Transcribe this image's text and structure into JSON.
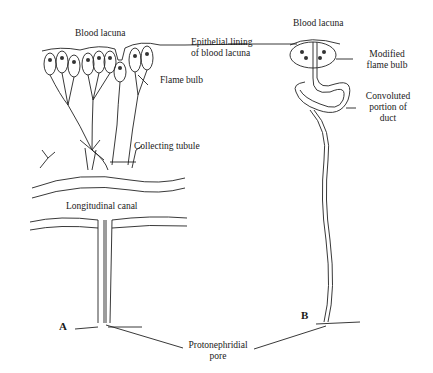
{
  "figure": {
    "panel_a": {
      "letter": "A",
      "labels": {
        "blood_lacuna": "Blood lacuna",
        "epithelial_lining_1": "Epithelial lining",
        "epithelial_lining_2": "of blood lacuna",
        "flame_bulb": "Flame bulb",
        "collecting_tubule": "Collecting tubule",
        "longitudinal_canal": "Longitudinal canal"
      }
    },
    "panel_b": {
      "letter": "B",
      "labels": {
        "blood_lacuna": "Blood lacuna",
        "modified_flame_bulb_1": "Modified",
        "modified_flame_bulb_2": "flame bulb",
        "convoluted_1": "Convoluted",
        "convoluted_2": "portion of",
        "convoluted_3": "duct"
      }
    },
    "shared": {
      "pore_1": "Protonephridial",
      "pore_2": "pore"
    }
  }
}
